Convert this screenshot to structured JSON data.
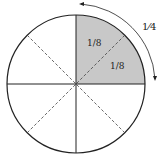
{
  "diagram": {
    "shaded_color": "#c8c8c8",
    "line_color": "#222222",
    "labels": {
      "top_eighth": "1/8",
      "right_eighth": "1/8",
      "quarter": "1⁄4"
    },
    "parts": 8,
    "shaded_parts": 2,
    "shaded_fraction": "1/4"
  }
}
